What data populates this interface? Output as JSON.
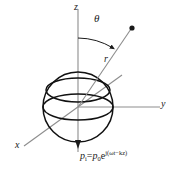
{
  "figure": {
    "kind": "spherical-coordinate-diagram",
    "background_color": "#ffffff",
    "axes": {
      "z_label": "z",
      "y_label": "y",
      "x_label": "x",
      "axis_color": "#888888"
    },
    "annotations": {
      "theta_label": "θ",
      "r_label": "r",
      "point_marker": "filled-dot"
    },
    "sphere": {
      "outline_color": "#111111",
      "center_x": 78,
      "center_y": 107,
      "radius": 35
    },
    "formula": {
      "lhs_symbol": "p",
      "lhs_subscript": "i",
      "equals": "=",
      "rhs_symbol": "p",
      "rhs_subscript": "0",
      "exp_base": "e",
      "exp_power": "j(ωt−kz)",
      "full_text": "pᵢ = p₀e^{j(ωt−kz)}"
    },
    "wave_direction": "downward-along-z"
  }
}
